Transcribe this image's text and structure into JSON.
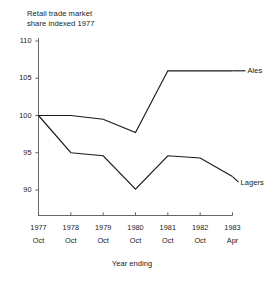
{
  "chart_data": {
    "type": "line",
    "title": "Retail trade market\nshare indexed 1977",
    "xlabel": "Year ending",
    "ylabel": "",
    "ylim": [
      86.5,
      110
    ],
    "yticks": [
      110,
      105,
      100,
      95,
      90
    ],
    "ytick_labels": [
      "110",
      "105",
      "100",
      "95",
      "90"
    ],
    "grid": false,
    "legend_position": "inline-right-of-line-end",
    "categories": [
      "1977 Oct",
      "1978 Oct",
      "1979 Oct",
      "1980 Oct",
      "1981 Oct",
      "1982 Oct",
      "1983 Apr"
    ],
    "xtick_years": [
      "1977",
      "1978",
      "1979",
      "1980",
      "1981",
      "1982",
      "1983"
    ],
    "xtick_months": [
      "Oct",
      "Oct",
      "Oct",
      "Oct",
      "Oct",
      "Oct",
      "Apr"
    ],
    "series": [
      {
        "name": "Ales",
        "color": "#1a1a1a",
        "values": [
          100,
          100,
          99.5,
          97.7,
          106,
          106,
          106
        ]
      },
      {
        "name": "Lagers",
        "color": "#1a1a1a",
        "values": [
          100,
          95,
          94.6,
          90.1,
          94.6,
          94.3,
          91.8
        ]
      }
    ],
    "axis_color": "#555555",
    "line_color": "#1a1a1a"
  },
  "labels": {
    "series_ales": "Ales",
    "series_lagers": "Lagers",
    "axis_title_x": "Year ending",
    "chart_title": "Retail trade market\nshare indexed 1977"
  }
}
